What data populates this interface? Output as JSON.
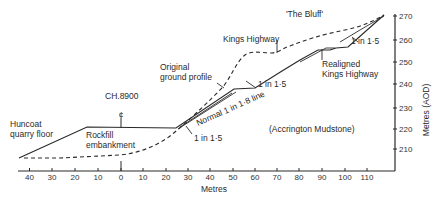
{
  "labels": {
    "the_bluff": "'The Bluff'",
    "kings_highway": "Kings Highway",
    "original_ground_1": "Original",
    "original_ground_2": "ground profile",
    "ch": "CH.8900",
    "centerline_symbol": "¢",
    "huncoat_1": "Huncoat",
    "huncoat_2": "quarry floor",
    "rockfill_1": "Rockfill",
    "rockfill_2": "embankment",
    "normal_line": "Normal 1 in 1·8 line",
    "slope_left": "1 in 1·5",
    "slope_mid": "1 in 1·5",
    "slope_top": "1 in 1·5",
    "realigned_1": "Realigned",
    "realigned_2": "Kings Highway",
    "mudstone": "(Accrington Mudstone)"
  },
  "x_axis": {
    "title": "Metres",
    "ticks": [
      "40",
      "30",
      "20",
      "10",
      "0",
      "10",
      "20",
      "30",
      "40",
      "50",
      "60",
      "70",
      "80",
      "90",
      "100",
      "110"
    ]
  },
  "y_axis": {
    "title": "Metres (AOD)",
    "ticks": [
      "270",
      "260",
      "250",
      "240",
      "230",
      "220",
      "210"
    ]
  },
  "colors": {
    "ink": "#2a2a2a",
    "background": "#ffffff"
  }
}
